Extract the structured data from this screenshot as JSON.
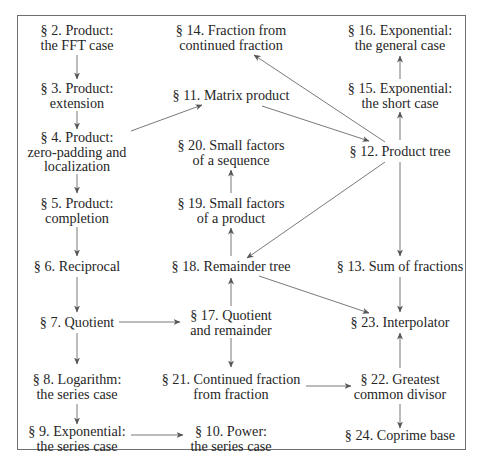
{
  "diagram": {
    "type": "dependency-graph",
    "nodes": [
      {
        "id": "s2",
        "line1": "§ 2. Product:",
        "line2": "the FFT case",
        "x": 77,
        "y": 37
      },
      {
        "id": "s3",
        "line1": "§ 3. Product:",
        "line2": "extension",
        "x": 77,
        "y": 95
      },
      {
        "id": "s4",
        "line1": "§ 4. Product:",
        "line2": "zero-padding and",
        "line3": "localization",
        "x": 77,
        "y": 151
      },
      {
        "id": "s5",
        "line1": "§ 5. Product:",
        "line2": "completion",
        "x": 77,
        "y": 209
      },
      {
        "id": "s6",
        "line1": "§ 6. Reciprocal",
        "x": 77,
        "y": 266
      },
      {
        "id": "s7",
        "line1": "§ 7. Quotient",
        "x": 77,
        "y": 322
      },
      {
        "id": "s8",
        "line1": "§ 8. Logarithm:",
        "line2": "the series case",
        "x": 77,
        "y": 386
      },
      {
        "id": "s9",
        "line1": "§ 9. Exponential:",
        "line2": "the series case",
        "x": 77,
        "y": 438
      },
      {
        "id": "s14",
        "line1": "§ 14. Fraction from",
        "line2": "continued fraction",
        "x": 231,
        "y": 37
      },
      {
        "id": "s11",
        "line1": "§ 11. Matrix product",
        "x": 231,
        "y": 95
      },
      {
        "id": "s20",
        "line1": "§ 20. Small factors",
        "line2": "of a sequence",
        "x": 231,
        "y": 151
      },
      {
        "id": "s19",
        "line1": "§ 19. Small factors",
        "line2": "of a product",
        "x": 231,
        "y": 209
      },
      {
        "id": "s18",
        "line1": "§ 18. Remainder tree",
        "x": 231,
        "y": 266
      },
      {
        "id": "s17",
        "line1": "§ 17. Quotient",
        "line2": "and remainder",
        "x": 231,
        "y": 322
      },
      {
        "id": "s21",
        "line1": "§ 21. Continued fraction",
        "line2": "from fraction",
        "x": 231,
        "y": 386
      },
      {
        "id": "s10",
        "line1": "§ 10. Power:",
        "line2": "the series case",
        "x": 231,
        "y": 438
      },
      {
        "id": "s16",
        "line1": "§ 16. Exponential:",
        "line2": "the general case",
        "x": 400,
        "y": 37
      },
      {
        "id": "s15",
        "line1": "§ 15. Exponential:",
        "line2": "the short case",
        "x": 400,
        "y": 95
      },
      {
        "id": "s12",
        "line1": "§ 12. Product tree",
        "x": 400,
        "y": 151
      },
      {
        "id": "s13",
        "line1": "§ 13. Sum of fractions",
        "x": 400,
        "y": 266
      },
      {
        "id": "s23",
        "line1": "§ 23. Interpolator",
        "x": 400,
        "y": 322
      },
      {
        "id": "s22",
        "line1": "§ 22. Greatest",
        "line2": "common divisor",
        "x": 400,
        "y": 386
      },
      {
        "id": "s24",
        "line1": "§ 24. Coprime base",
        "x": 400,
        "y": 438
      }
    ],
    "edges": [
      {
        "from": "s2",
        "to": "s3"
      },
      {
        "from": "s3",
        "to": "s4"
      },
      {
        "from": "s4",
        "to": "s5"
      },
      {
        "from": "s5",
        "to": "s6"
      },
      {
        "from": "s6",
        "to": "s7"
      },
      {
        "from": "s7",
        "to": "s8"
      },
      {
        "from": "s8",
        "to": "s9"
      },
      {
        "from": "s4",
        "to": "s11"
      },
      {
        "from": "s11",
        "to": "s12"
      },
      {
        "from": "s12",
        "to": "s14"
      },
      {
        "from": "s12",
        "to": "s15"
      },
      {
        "from": "s15",
        "to": "s16"
      },
      {
        "from": "s12",
        "to": "s13"
      },
      {
        "from": "s12",
        "to": "s18"
      },
      {
        "from": "s13",
        "to": "s23"
      },
      {
        "from": "s18",
        "to": "s23"
      },
      {
        "from": "s18",
        "to": "s19"
      },
      {
        "from": "s19",
        "to": "s20"
      },
      {
        "from": "s17",
        "to": "s18"
      },
      {
        "from": "s7",
        "to": "s17"
      },
      {
        "from": "s17",
        "to": "s21"
      },
      {
        "from": "s21",
        "to": "s22"
      },
      {
        "from": "s22",
        "to": "s23"
      },
      {
        "from": "s22",
        "to": "s24"
      },
      {
        "from": "s9",
        "to": "s10"
      }
    ]
  }
}
